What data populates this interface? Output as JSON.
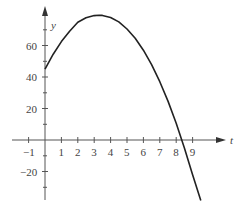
{
  "chart_data": {
    "type": "line",
    "title": "",
    "xlabel": "t",
    "ylabel": "y",
    "x_ticks": [
      "-1",
      "1",
      "2",
      "3",
      "4",
      "5",
      "6",
      "7",
      "8",
      "9"
    ],
    "y_ticks": [
      "60",
      "40",
      "20",
      "-20"
    ],
    "xlim": [
      -1.6,
      10.6
    ],
    "ylim": [
      -38,
      88
    ],
    "grid": false,
    "legend": null,
    "series": [
      {
        "name": "y(t)",
        "x": [
          0,
          0.5,
          1,
          1.5,
          2,
          2.5,
          3,
          3.3,
          3.5,
          4,
          4.5,
          5,
          5.5,
          6,
          6.5,
          7,
          7.5,
          8,
          8.5,
          9,
          9.5
        ],
        "values": [
          45,
          54.5,
          62.5,
          69.0,
          74.8,
          77.6,
          79.0,
          79.2,
          79.1,
          77.8,
          75.0,
          70.5,
          64.6,
          57.0,
          47.8,
          37.0,
          24.7,
          10.6,
          -5.0,
          -22.1,
          -38.5
        ]
      }
    ],
    "colors": {
      "curve": "#222222",
      "axis": "#555555"
    }
  }
}
